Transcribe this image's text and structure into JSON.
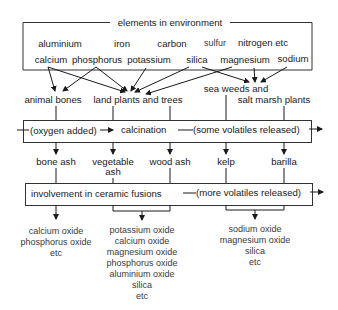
{
  "diagram": {
    "environment_box": {
      "title": "elements in environment",
      "row1": [
        "aluminium",
        "iron",
        "carbon",
        "sulfur",
        "nitrogen etc"
      ],
      "row2": [
        "calcium",
        "phosphorus",
        "potassium",
        "silica",
        "magnesium",
        "sodium"
      ]
    },
    "sources": {
      "animal_bones": "animal bones",
      "land_plants": "land plants and trees",
      "sea_weeds_line1": "sea weeds and",
      "sea_weeds_line2": "salt marsh plants"
    },
    "calcination_box": {
      "input_note": "(oxygen added)",
      "label": "calcination",
      "output_note": "(some volatiles released)"
    },
    "ashes": {
      "bone_ash": "bone ash",
      "vegetable_ash_line1": "vegetable",
      "vegetable_ash_line2": "ash",
      "wood_ash": "wood ash",
      "kelp": "kelp",
      "barilla": "barilla"
    },
    "fusion_box": {
      "label": "involvement in ceramic fusions",
      "output_note": "(more volatiles released)"
    },
    "oxides": {
      "bone_products": [
        "calcium oxide",
        "phosphorus oxide",
        "etc"
      ],
      "plant_products": [
        "potassium oxide",
        "calcium oxide",
        "magnesium oxide",
        "phosphorus oxide",
        "aluminium oxide",
        "silica",
        "etc"
      ],
      "sea_products": [
        "sodium oxide",
        "magnesium oxide",
        "silica",
        "etc"
      ]
    }
  }
}
